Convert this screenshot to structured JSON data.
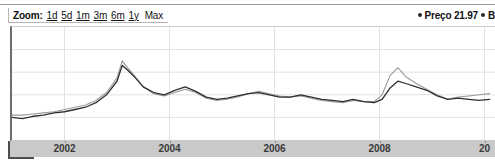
{
  "toolbar": {
    "zoom_label": "Zoom:",
    "ranges": [
      {
        "label": "1d",
        "underlined": true
      },
      {
        "label": "5d",
        "underlined": true
      },
      {
        "label": "1m",
        "underlined": true
      },
      {
        "label": "3m",
        "underlined": true
      },
      {
        "label": "6m",
        "underlined": true
      },
      {
        "label": "1y",
        "underlined": true
      },
      {
        "label": "Max",
        "underlined": false
      }
    ]
  },
  "legend": {
    "entries": [
      {
        "marker": "bullet-dot",
        "label": "Preço 21.97",
        "color": "#2b2b2b"
      },
      {
        "marker": "bullet-dot",
        "label": "B",
        "color": "#2b2b2b"
      }
    ]
  },
  "colors": {
    "series_price": "#2e2e2e",
    "series_benchmark": "#9a9a9a",
    "axis": "#6e6e6e",
    "gridline": "#e2e2e2",
    "axis_band": "#c9c9c9",
    "toolbar_border": "#b4b4b4"
  },
  "chart_data": {
    "type": "line",
    "title": "",
    "xlabel": "",
    "ylabel": "",
    "grid": true,
    "legend_position": "top-right",
    "xlim": [
      2001.0,
      2010.2
    ],
    "ylim": [
      0,
      100
    ],
    "xticks": [
      2002,
      2004,
      2006,
      2008,
      2010
    ],
    "xticklabels": [
      "2002",
      "2004",
      "2006",
      "2008",
      "20"
    ],
    "gridlines_y": [
      20,
      40,
      60,
      80
    ],
    "series": [
      {
        "name": "Preço",
        "color": "#2e2e2e",
        "current_value": 21.97,
        "x": [
          2001.0,
          2001.2,
          2001.4,
          2001.6,
          2001.8,
          2002.0,
          2002.2,
          2002.4,
          2002.6,
          2002.8,
          2003.0,
          2003.1,
          2003.2,
          2003.35,
          2003.5,
          2003.7,
          2003.9,
          2004.1,
          2004.3,
          2004.5,
          2004.7,
          2004.9,
          2005.1,
          2005.3,
          2005.5,
          2005.7,
          2005.9,
          2006.1,
          2006.3,
          2006.5,
          2006.7,
          2006.9,
          2007.1,
          2007.3,
          2007.5,
          2007.7,
          2007.9,
          2008.05,
          2008.2,
          2008.35,
          2008.5,
          2008.7,
          2008.9,
          2009.1,
          2009.3,
          2009.5,
          2009.7,
          2009.9,
          2010.1
        ],
        "y": [
          20,
          19,
          21,
          22,
          24,
          25,
          27,
          29,
          33,
          40,
          52,
          66,
          62,
          55,
          47,
          42,
          40,
          44,
          47,
          43,
          38,
          36,
          37,
          39,
          41,
          42,
          40,
          38,
          38,
          40,
          38,
          36,
          35,
          34,
          36,
          34,
          33,
          36,
          46,
          52,
          50,
          47,
          44,
          39,
          36,
          37,
          36,
          35,
          36
        ]
      },
      {
        "name": "Benchmark",
        "color": "#9a9a9a",
        "x": [
          2001.0,
          2001.2,
          2001.4,
          2001.6,
          2001.8,
          2002.0,
          2002.2,
          2002.4,
          2002.6,
          2002.8,
          2003.0,
          2003.1,
          2003.2,
          2003.35,
          2003.5,
          2003.7,
          2003.9,
          2004.1,
          2004.3,
          2004.5,
          2004.7,
          2004.9,
          2005.1,
          2005.3,
          2005.5,
          2005.7,
          2005.9,
          2006.1,
          2006.3,
          2006.5,
          2006.7,
          2006.9,
          2007.1,
          2007.3,
          2007.5,
          2007.7,
          2007.9,
          2008.05,
          2008.2,
          2008.35,
          2008.5,
          2008.7,
          2008.9,
          2009.1,
          2009.3,
          2009.5,
          2009.7,
          2009.9,
          2010.1
        ],
        "y": [
          22,
          22,
          23,
          24,
          25,
          27,
          29,
          31,
          35,
          42,
          55,
          70,
          64,
          56,
          47,
          41,
          39,
          42,
          45,
          42,
          37,
          35,
          36,
          38,
          41,
          43,
          41,
          39,
          38,
          39,
          37,
          35,
          34,
          33,
          35,
          34,
          34,
          40,
          57,
          64,
          56,
          50,
          45,
          40,
          36,
          38,
          39,
          40,
          41
        ]
      }
    ]
  }
}
